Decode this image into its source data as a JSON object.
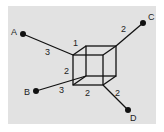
{
  "colors": {
    "panel": "#e2e2e2",
    "line": "#111111",
    "text": "#222222"
  },
  "nodes": [
    {
      "id": "A",
      "label": "A",
      "x": 23,
      "y": 34,
      "lx": 11,
      "ly": 35
    },
    {
      "id": "B",
      "label": "B",
      "x": 36,
      "y": 91,
      "lx": 24,
      "ly": 95
    },
    {
      "id": "C",
      "label": "C",
      "x": 143,
      "y": 23,
      "lx": 148,
      "ly": 20
    },
    {
      "id": "D",
      "label": "D",
      "x": 128,
      "y": 110,
      "lx": 130,
      "ly": 121
    }
  ],
  "cube": {
    "front": {
      "x1": 73,
      "y1": 55,
      "x2": 103,
      "y2": 85
    },
    "back": {
      "x1": 86,
      "y1": 46,
      "x2": 116,
      "y2": 76
    }
  },
  "edges": [
    {
      "from": "A",
      "x1": 23,
      "y1": 34,
      "x2": 73,
      "y2": 55,
      "weight": "3",
      "wx": 45,
      "wy": 55
    },
    {
      "from": "B",
      "x1": 36,
      "y1": 91,
      "x2": 86,
      "y2": 76,
      "weight": "3",
      "wx": 59,
      "wy": 93
    },
    {
      "from": "C",
      "x1": 143,
      "y1": 23,
      "x2": 116,
      "y2": 46,
      "weight": "2",
      "wx": 121,
      "wy": 32
    },
    {
      "from": "D",
      "x1": 128,
      "y1": 110,
      "x2": 103,
      "y2": 85,
      "weight": "2",
      "wx": 115,
      "wy": 96
    }
  ],
  "cube_labels": [
    {
      "text": "1",
      "x": 73,
      "y": 46
    },
    {
      "text": "2",
      "x": 64,
      "y": 74
    },
    {
      "text": "2",
      "x": 85,
      "y": 96
    }
  ]
}
